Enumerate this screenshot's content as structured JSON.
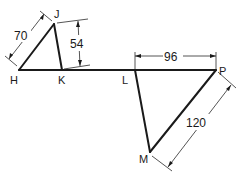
{
  "diagram": {
    "type": "geometry-dimensioned-triangles",
    "points": {
      "H": {
        "label": "H"
      },
      "J": {
        "label": "J"
      },
      "K": {
        "label": "K"
      },
      "L": {
        "label": "L"
      },
      "P": {
        "label": "P"
      },
      "M": {
        "label": "M"
      }
    },
    "dimensions": {
      "HJ": "70",
      "JK_vertical": "54",
      "LP": "96",
      "MP": "120"
    },
    "colors": {
      "line": "#1a1a1a",
      "background": "#ffffff"
    }
  }
}
